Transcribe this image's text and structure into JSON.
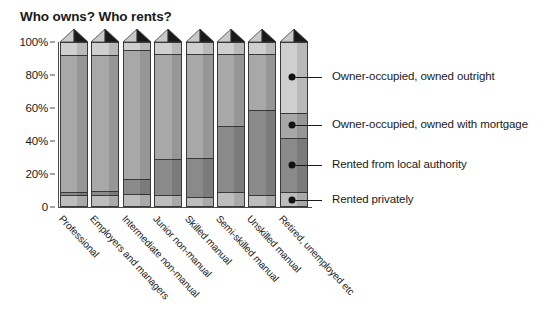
{
  "chart": {
    "title": "Who owns? Who rents?",
    "y_ticks": [
      "100%",
      "80%",
      "60%",
      "40%",
      "20%",
      "0"
    ],
    "categories": [
      "Professional",
      "Employers and managers",
      "Intermediate non-manual",
      "Junior non-manual",
      "Skilled manual",
      "Semi-skilled manual",
      "Unskilled manual",
      "Retired, unemployed etc"
    ],
    "legend": [
      "Owner-occupied, owned outright",
      "Owner-occupied, owned with mortgage",
      "Rented from local authority",
      "Rented privately"
    ]
  },
  "chart_data": {
    "type": "bar",
    "stacked": true,
    "orientation": "vertical",
    "title": "Who owns? Who rents?",
    "xlabel": "",
    "ylabel": "",
    "ylim": [
      0,
      100
    ],
    "yticks": [
      0,
      20,
      40,
      60,
      80,
      100
    ],
    "ytick_labels": [
      "0",
      "20%",
      "40%",
      "60%",
      "80%",
      "100%"
    ],
    "grid": false,
    "legend_position": "right",
    "units": "percent",
    "categories": [
      "Professional",
      "Employers and managers",
      "Intermediate non-manual",
      "Junior non-manual",
      "Skilled manual",
      "Semi-skilled manual",
      "Unskilled manual",
      "Retired, unemployed etc"
    ],
    "series": [
      {
        "name": "Rented privately",
        "color": "#bdbdbd",
        "values": [
          7,
          7,
          8,
          7,
          6,
          9,
          7,
          9
        ]
      },
      {
        "name": "Rented from local authority",
        "color": "#8a8a8a",
        "values": [
          2,
          3,
          9,
          22,
          24,
          40,
          52,
          33
        ]
      },
      {
        "name": "Owner-occupied, owned with mortgage",
        "color": "#a8a8a8",
        "values": [
          83,
          82,
          78,
          64,
          63,
          44,
          34,
          15
        ]
      },
      {
        "name": "Owner-occupied, owned outright",
        "color": "#cfcfcf",
        "values": [
          8,
          8,
          5,
          7,
          7,
          7,
          7,
          43
        ]
      }
    ]
  },
  "palette": {
    "outright": "#cfcfcf",
    "mortgage": "#a8a8a8",
    "local_authority": "#8a8a8a",
    "private": "#bdbdbd",
    "roof_dark": "#1a1a1a",
    "roof_light": "#c9c9c9",
    "outline": "#3a3a3a",
    "text": "#1a1a1a"
  }
}
